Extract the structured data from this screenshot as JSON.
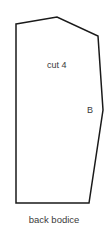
{
  "diagram": {
    "type": "sewing-pattern-piece",
    "piece": {
      "name": "back bodice",
      "outline_color": "#1a1a1a",
      "outline_points": [
        [
          16,
          24
        ],
        [
          57,
          17
        ],
        [
          98,
          36
        ],
        [
          103,
          110
        ],
        [
          89,
          203
        ],
        [
          16,
          203
        ]
      ]
    },
    "annotations": {
      "cut_instruction": "cut 4",
      "notch_marker": "B"
    },
    "caption": "back bodice"
  }
}
